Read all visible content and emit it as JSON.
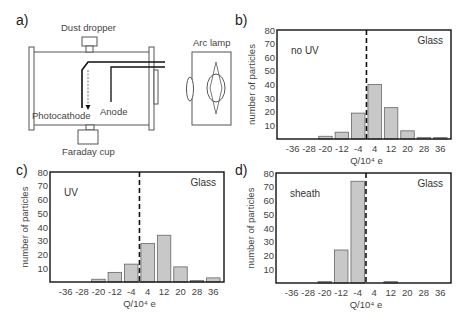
{
  "panels": {
    "a": {
      "label": "a)",
      "dust_dropper": "Dust dropper",
      "arc_lamp": "Arc lamp",
      "photocathode": "Photocathode",
      "anode": "Anode",
      "faraday_cup": "Faraday cup"
    },
    "b": {
      "label": "b)"
    },
    "c": {
      "label": "c)"
    },
    "d": {
      "label": "d)"
    }
  },
  "chart_data": [
    {
      "panel": "b",
      "type": "bar",
      "categories": [
        -36,
        -28,
        -20,
        -12,
        -4,
        4,
        12,
        20,
        28,
        36
      ],
      "values": [
        0,
        0,
        2,
        5,
        19,
        40,
        23,
        6,
        1,
        1
      ],
      "annotation_left": "no UV",
      "annotation_right": "Glass",
      "xlabel": "Q/10⁴ e",
      "ylabel": "number of particles",
      "yticks": [
        10,
        20,
        30,
        40,
        50,
        60,
        70,
        80
      ],
      "ylim": [
        0,
        80
      ],
      "dashed_line_at": 0,
      "grid": false
    },
    {
      "panel": "c",
      "type": "bar",
      "categories": [
        -36,
        -28,
        -20,
        -12,
        -4,
        4,
        12,
        20,
        28,
        36
      ],
      "values": [
        0,
        0,
        2,
        7,
        13,
        28,
        34,
        11,
        1,
        3
      ],
      "annotation_left": "UV",
      "annotation_right": "Glass",
      "xlabel": "Q/10⁴ e",
      "ylabel": "number of particles",
      "yticks": [
        10,
        20,
        30,
        40,
        50,
        60,
        70,
        80
      ],
      "ylim": [
        0,
        80
      ],
      "dashed_line_at": 0,
      "grid": false
    },
    {
      "panel": "d",
      "type": "bar",
      "categories": [
        -36,
        -28,
        -20,
        -12,
        -4,
        4,
        12,
        20,
        28,
        36
      ],
      "values": [
        0,
        0,
        1,
        24,
        74,
        0,
        1,
        0,
        0,
        0
      ],
      "annotation_left": "sheath",
      "annotation_right": "Glass",
      "xlabel": "Q/10⁴ e",
      "ylabel": "number of particles",
      "yticks": [
        10,
        20,
        30,
        40,
        50,
        60,
        70,
        80
      ],
      "ylim": [
        0,
        80
      ],
      "dashed_line_at": 0,
      "grid": false
    }
  ]
}
